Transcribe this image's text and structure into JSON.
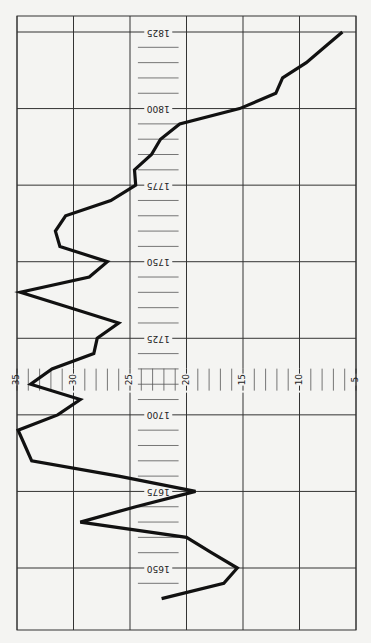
{
  "chart_data": {
    "type": "line",
    "title": "",
    "orientation": "rotated 90° — year axis runs vertically (bottom = 1650, top = 1825), value axis runs horizontally (left = 35, right = 5)",
    "xlabel": "Year",
    "ylabel": "",
    "x_tick_labels": [
      "1650",
      "1675",
      "1700",
      "1725",
      "1750",
      "1775",
      "1800",
      "1825"
    ],
    "y_tick_labels": [
      "35",
      "30",
      "25",
      "20",
      "15",
      "10",
      "5"
    ],
    "ylim": [
      5,
      35
    ],
    "xlim": [
      1640,
      1830
    ],
    "grid": true,
    "legend": null,
    "x": [
      1640,
      1645,
      1650,
      1655,
      1660,
      1665,
      1670,
      1675,
      1680,
      1685,
      1690,
      1695,
      1700,
      1705,
      1710,
      1715,
      1720,
      1725,
      1730,
      1735,
      1740,
      1745,
      1750,
      1755,
      1760,
      1765,
      1770,
      1775,
      1780,
      1785,
      1790,
      1795,
      1800,
      1805,
      1810,
      1815,
      1820,
      1825
    ],
    "series": [
      {
        "name": "series-1",
        "values": [
          22.2,
          16.7,
          15.5,
          17.8,
          20.0,
          29.4,
          24.5,
          19.2,
          26.0,
          33.7,
          34.3,
          34.9,
          31.4,
          29.4,
          33.8,
          31.9,
          28.2,
          27.9,
          26.0,
          30.3,
          34.7,
          28.6,
          27.0,
          31.2,
          31.6,
          30.7,
          26.7,
          24.5,
          24.6,
          23.1,
          22.3,
          20.6,
          15.3,
          12.1,
          11.5,
          9.4,
          7.8,
          6.2
        ]
      }
    ]
  }
}
